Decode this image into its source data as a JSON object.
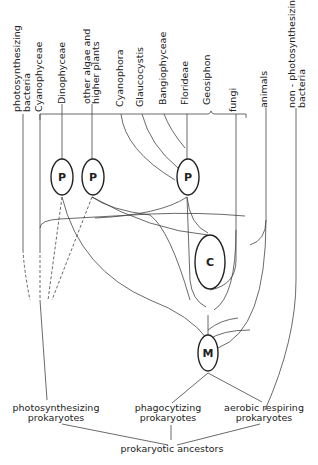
{
  "diagram": {
    "top_labels": [
      {
        "id": "photosynthesizing-bacteria",
        "line1": "photosynthesizing",
        "line2": "bacteria"
      },
      {
        "id": "cyanophyceae",
        "line1": "Cyanophyceae",
        "line2": ""
      },
      {
        "id": "dinophyceae",
        "line1": "Dinophyceae",
        "line2": ""
      },
      {
        "id": "other-algae",
        "line1": "other algae and",
        "line2": "higher plants"
      },
      {
        "id": "cyanophora",
        "line1": "Cyanophora",
        "line2": ""
      },
      {
        "id": "glaucocystis",
        "line1": "Glaucocystis",
        "line2": ""
      },
      {
        "id": "bangiophyceae",
        "line1": "Bangiophyceae",
        "line2": ""
      },
      {
        "id": "florideae",
        "line1": "Florideae",
        "line2": ""
      },
      {
        "id": "geosiphon",
        "line1": "Geosiphon",
        "line2": ""
      },
      {
        "id": "fungi",
        "line1": "fungi",
        "line2": ""
      },
      {
        "id": "animals",
        "line1": "animals",
        "line2": ""
      },
      {
        "id": "non-photosynthesizing-bacteria",
        "line1": "non - photosynthesizing",
        "line2": "bacteria"
      }
    ],
    "nodes": {
      "p1": "P",
      "p2": "P",
      "p3": "P",
      "c": "C",
      "m": "M"
    },
    "bottom_labels": {
      "photosynthesizing": {
        "line1": "photosynthesizing",
        "line2": "prokaryotes"
      },
      "phagocytizing": {
        "line1": "phagocytizing",
        "line2": "prokaryotes"
      },
      "aerobic": {
        "line1": "aerobic  respiring",
        "line2": "prokaryotes"
      },
      "ancestors": "prokaryotic  ancestors"
    }
  }
}
